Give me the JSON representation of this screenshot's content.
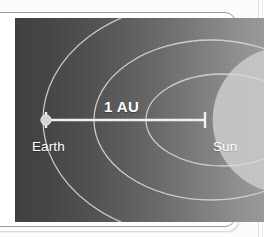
{
  "figure": {
    "labels": {
      "distance": "1 AU",
      "earth": "Earth",
      "sun": "Sun"
    },
    "icon_names": {
      "earth_marker": "earth-planet-dot-icon",
      "left_tick": "measurement-tick-left-icon",
      "right_tick": "measurement-tick-right-icon",
      "sun_disc": "sun-disc-icon",
      "orbit_arcs": "orbit-ellipse-arcs-icon"
    },
    "colors": {
      "panel_dark": "#3f3f3f",
      "panel_light": "#9a9a9a",
      "sun_fill": "#c9c9c9",
      "orbit_stroke": "#d8d8d8",
      "measure_line": "#f2f2f2",
      "label_text": "#ffffff",
      "card_border": "#9b9b9b",
      "page_background": "#fcfcfc",
      "rule_line": "#dcdcdc"
    },
    "geometry": {
      "measure_line_start_x": 46,
      "measure_line_end_x": 205,
      "measure_line_y": 120,
      "orbit_vertex_x": [
        43,
        94,
        146
      ],
      "sun_center_x": 286,
      "sun_center_y": 120,
      "sun_radius": 73
    }
  }
}
